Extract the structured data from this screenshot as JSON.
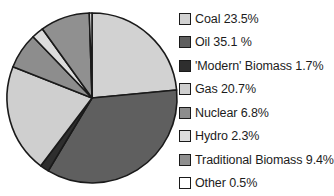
{
  "chart_data": {
    "type": "pie",
    "title": "",
    "start_angle_deg": 0,
    "direction": "clockwise",
    "legend_position": "right",
    "slices": [
      {
        "name": "Coal",
        "value": 23.5,
        "label": "Coal 23.5%",
        "color": "#d2d2d2"
      },
      {
        "name": "Oil",
        "value": 35.1,
        "label": "Oil 35.1 %",
        "color": "#5f5f5f"
      },
      {
        "name": "'Modern' Biomass",
        "value": 1.7,
        "label": "'Modern' Biomass 1.7%",
        "color": "#2e2e2e"
      },
      {
        "name": "Gas",
        "value": 20.7,
        "label": "Gas 20.7%",
        "color": "#cfcfcf"
      },
      {
        "name": "Nuclear",
        "value": 6.8,
        "label": "Nuclear 6.8%",
        "color": "#8d8d8d"
      },
      {
        "name": "Hydro",
        "value": 2.3,
        "label": "Hydro 2.3%",
        "color": "#dcdcdc"
      },
      {
        "name": "Traditional Biomass",
        "value": 9.4,
        "label": "Traditional Biomass 9.4%",
        "color": "#909090"
      },
      {
        "name": "Other",
        "value": 0.5,
        "label": "Other 0.5%",
        "color": "#ffffff"
      }
    ]
  },
  "legend": {
    "items": [
      {
        "label": "Coal 23.5%"
      },
      {
        "label": "Oil 35.1 %"
      },
      {
        "label": "'Modern' Biomass 1.7%"
      },
      {
        "label": "Gas 20.7%"
      },
      {
        "label": "Nuclear 6.8%"
      },
      {
        "label": "Hydro 2.3%"
      },
      {
        "label": "Traditional Biomass 9.4%"
      },
      {
        "label": "Other 0.5%"
      }
    ]
  }
}
